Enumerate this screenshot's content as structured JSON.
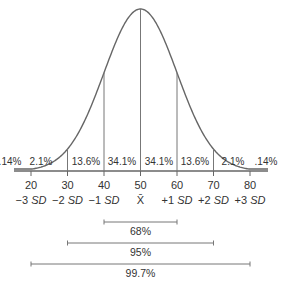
{
  "chart_data": {
    "type": "line",
    "title": "",
    "xlabel": "",
    "ylabel": "",
    "x_ticks": [
      "20",
      "30",
      "40",
      "50",
      "60",
      "70",
      "80"
    ],
    "sd_labels": [
      "−3 SD",
      "−2 SD",
      "−1 SD",
      "X̄",
      "+1 SD",
      "+2 SD",
      "+3 SD"
    ],
    "mean": 50,
    "sd": 10,
    "band_percentages": [
      ".14%",
      "2.1%",
      "13.6%",
      "34.1%",
      "34.1%",
      "13.6%",
      "2.1%",
      ".14%"
    ],
    "ranges": [
      {
        "label": "68%",
        "from": 40,
        "to": 60
      },
      {
        "label": "95%",
        "from": 30,
        "to": 70
      },
      {
        "label": "99.7%",
        "from": 20,
        "to": 80
      }
    ],
    "grid": false,
    "legend": "none"
  }
}
